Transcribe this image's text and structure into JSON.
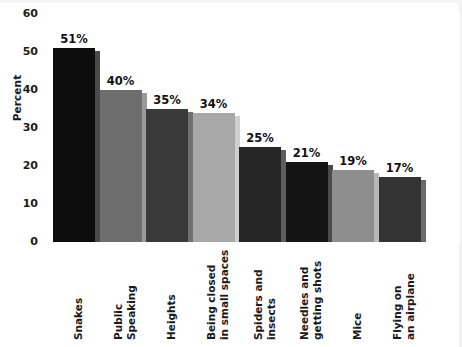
{
  "chart_data": {
    "type": "bar",
    "title": "",
    "xlabel": "",
    "ylabel": "Percent",
    "ylim": [
      0,
      60
    ],
    "yticks": [
      0,
      10,
      20,
      30,
      40,
      50,
      60
    ],
    "grid": false,
    "legend": "none",
    "categories": [
      "Snakes",
      "Public\nSpeaking",
      "Heights",
      "Being closed\nin small spaces",
      "Spiders and\ninsects",
      "Needles and\ngetting shots",
      "Mice",
      "Flying on\nan airplane"
    ],
    "values": [
      51,
      40,
      35,
      34,
      25,
      21,
      19,
      17
    ],
    "value_labels": [
      "51%",
      "40%",
      "35%",
      "34%",
      "25%",
      "21%",
      "19%",
      "17%"
    ],
    "bar_colors": [
      "#0d0d0d",
      "#6e6e6e",
      "#3a3a3a",
      "#a8a8a8",
      "#262626",
      "#141414",
      "#8e8e8e",
      "#333333"
    ],
    "bar_shadow_colors": [
      "#4a4a4a",
      "#9a9a9a",
      "#707070",
      "#cfcfcf",
      "#5e5e5e",
      "#4a4a4a",
      "#b8b8b8",
      "#6a6a6a"
    ]
  },
  "axis": {
    "y_title": "Percent",
    "tick_0": "0",
    "tick_10": "10",
    "tick_20": "20",
    "tick_30": "30",
    "tick_40": "40",
    "tick_50": "50",
    "tick_60": "60"
  }
}
